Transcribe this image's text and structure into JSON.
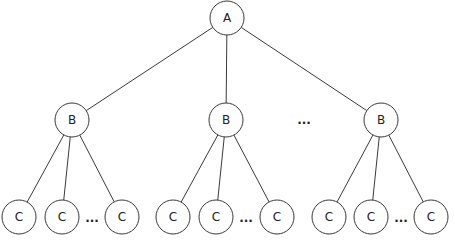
{
  "diagram": {
    "type": "tree",
    "node_radius": 17,
    "colors": {
      "stroke": "#3a3a3a",
      "text": "#222222",
      "background": "#ffffff"
    },
    "root": {
      "id": "A",
      "label": "A",
      "x": 227,
      "y": 18
    },
    "level1": [
      {
        "id": "B1",
        "label": "B",
        "x": 72,
        "y": 120
      },
      {
        "id": "B2",
        "label": "B",
        "x": 226,
        "y": 120
      },
      {
        "id": "B3",
        "label": "B",
        "x": 381,
        "y": 120
      }
    ],
    "level1_ellipsis": {
      "label": "...",
      "x": 304,
      "y": 120
    },
    "level2_groups": [
      {
        "parent": "B1",
        "children": [
          {
            "label": "C",
            "x": 19,
            "y": 217
          },
          {
            "label": "C",
            "x": 62,
            "y": 217
          },
          {
            "label": "C",
            "x": 122,
            "y": 217
          }
        ],
        "ellipsis": {
          "label": "...",
          "x": 92,
          "y": 218
        }
      },
      {
        "parent": "B2",
        "children": [
          {
            "label": "C",
            "x": 173,
            "y": 217
          },
          {
            "label": "C",
            "x": 216,
            "y": 217
          },
          {
            "label": "C",
            "x": 277,
            "y": 217
          }
        ],
        "ellipsis": {
          "label": "...",
          "x": 246,
          "y": 218
        }
      },
      {
        "parent": "B3",
        "children": [
          {
            "label": "C",
            "x": 329,
            "y": 217
          },
          {
            "label": "C",
            "x": 371,
            "y": 217
          },
          {
            "label": "C",
            "x": 431,
            "y": 217
          }
        ],
        "ellipsis": {
          "label": "...",
          "x": 401,
          "y": 218
        }
      }
    ]
  }
}
